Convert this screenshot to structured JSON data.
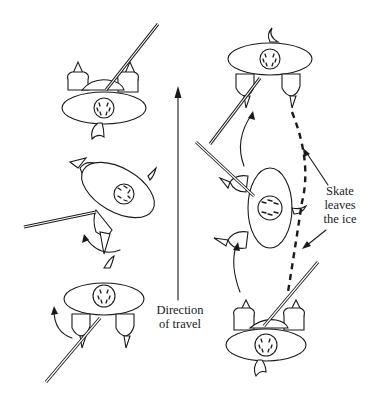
{
  "diagram": {
    "type": "illustration",
    "labels": {
      "direction": [
        "Direction",
        "of travel"
      ],
      "skate": [
        "Skate",
        "leaves",
        "the ice"
      ]
    },
    "figures": [
      {
        "id": "left-top",
        "pose": "facing up, stick pointing up-right"
      },
      {
        "id": "left-middle",
        "pose": "rotated, stick pointing left"
      },
      {
        "id": "left-bottom",
        "pose": "facing up, stick pointing down-left"
      },
      {
        "id": "right-top",
        "pose": "facing down, stick pointing down-left"
      },
      {
        "id": "right-middle",
        "pose": "rotated sideways, stick pointing up-left"
      },
      {
        "id": "right-bottom",
        "pose": "facing up, stick pointing up-right"
      }
    ],
    "arrows": [
      {
        "id": "direction-arrow",
        "style": "solid",
        "direction": "up"
      },
      {
        "id": "skate-path",
        "style": "dashed"
      },
      {
        "id": "rotation-arrows",
        "style": "curved solid"
      }
    ],
    "colors": {
      "ink": "#1a1a1a",
      "background": "#ffffff"
    }
  }
}
